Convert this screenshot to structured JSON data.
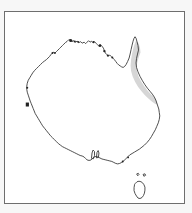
{
  "figure": {
    "kind": "outline-map",
    "region": "Australia",
    "frame": {
      "border_color": "#6e6e6e",
      "background_color": "#ffffff",
      "outer_margin_color": "#f7f7f7",
      "x": 4,
      "y": 11,
      "width": 181,
      "height": 193
    },
    "coastline": {
      "name": "australia-mainland-coastline",
      "stroke_color": "#3a3a3a",
      "stroke_width": 0.9,
      "fill": "none"
    },
    "islands": [
      {
        "name": "tasmania",
        "stroke_color": "#3a3a3a",
        "fill": "none"
      }
    ],
    "shaded_region": {
      "name": "queensland-east-coast-shading",
      "label": "",
      "fill_color": "#d6d6d6",
      "description_extent": "northeast coastal strip from Cape York base south to central Queensland coast"
    },
    "coast_marks": {
      "name": "dark-coastal-notches",
      "fill_color": "#222222",
      "count": 12
    },
    "labels": [],
    "legend": [],
    "title": "",
    "annotations": []
  }
}
